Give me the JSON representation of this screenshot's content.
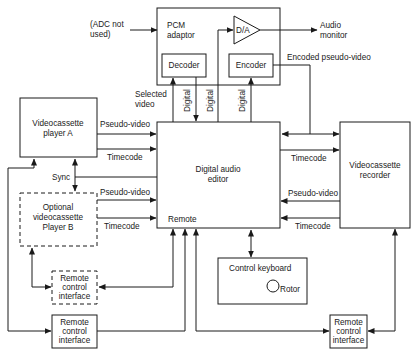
{
  "diagram": {
    "blocks": {
      "pcm_adaptor": {
        "line1": "PCM",
        "line2": "adaptor"
      },
      "decoder": {
        "label": "Decoder"
      },
      "encoder": {
        "label": "Encoder"
      },
      "da_converter": {
        "label": "D/A"
      },
      "vcp_a": {
        "line1": "Videocassette",
        "line2": "player A"
      },
      "vcp_b": {
        "line1": "Optional",
        "line2": "videocassette",
        "line3": "Player B"
      },
      "editor": {
        "line1": "Digital audio",
        "line2": "editor",
        "remote_label": "Remote"
      },
      "vcr": {
        "line1": "Videocassette",
        "line2": "recorder"
      },
      "control_keyboard": {
        "label": "Control keyboard",
        "rotor_label": "Rotor"
      },
      "remote_if_optional": {
        "line1": "Remote",
        "line2": "control",
        "line3": "interface"
      },
      "remote_if_left": {
        "line1": "Remote",
        "line2": "control",
        "line3": "interface"
      },
      "remote_if_right": {
        "line1": "Remote",
        "line2": "control",
        "line3": "interface"
      }
    },
    "annotations": {
      "adc_note_line1": "(ADC not",
      "adc_note_line2": "used)",
      "audio_monitor_line1": "Audio",
      "audio_monitor_line2": "monitor",
      "encoded_pseudo_video": "Encoded pseudo-video",
      "selected_video_line1": "Selected",
      "selected_video_line2": "video",
      "digital_1": "Digital",
      "digital_2": "Digital",
      "digital_3": "Digital",
      "sync": "Sync",
      "a_pseudo_video": "Pseudo-video",
      "a_timecode": "Timecode",
      "b_pseudo_video": "Pseudo-video",
      "b_timecode": "Timecode",
      "vcr_timecode_in": "Timecode",
      "vcr_pseudo_video_out": "Pseudo-video",
      "vcr_timecode_out": "Timecode"
    },
    "colors": {
      "ink": "#1a1a1a",
      "background": "#ffffff"
    }
  }
}
